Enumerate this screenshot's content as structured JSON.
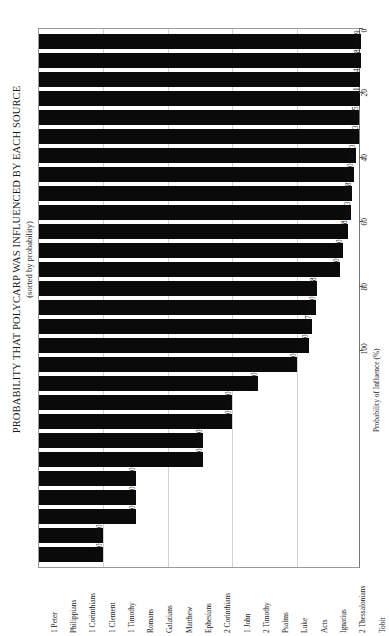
{
  "chart_data": {
    "type": "bar",
    "orientation": "vertical-rotated",
    "title": "PROBABILITY THAT POLYCARP WAS INFLUENCED BY EACH SOURCE",
    "subtitle": "(sorted by probability)",
    "xlabel": "",
    "ylabel": "Probability of Influence (%)",
    "ylim": [
      0,
      100
    ],
    "grid": true,
    "legend": null,
    "tick_labels": [
      "0",
      "20",
      "40",
      "60",
      "80",
      "100"
    ],
    "ticks": [
      0,
      20,
      40,
      60,
      80,
      100
    ],
    "categories": [
      "1 Peter",
      "Philippians",
      "1 Corinthians",
      "1 Clement",
      "1 Timothy",
      "Romans",
      "Galatians",
      "Matthew",
      "Ephesians",
      "2 Corinthians",
      "1 John",
      "2 Timothy",
      "Psalms",
      "Luke",
      "Acts",
      "Ignatius",
      "2 Thessalonians",
      "Tobit",
      "Proverbs",
      "Isaiah",
      "Jeremiah",
      "Hebrews",
      "John",
      "Ezekiel",
      "Mark",
      "1 Thessalonians",
      "Colossians",
      "Sirach"
    ],
    "values": [
      99.99,
      99.88,
      99.74,
      99.61,
      99.45,
      99.23,
      98.43,
      97.8,
      97.18,
      96.93,
      96.08,
      94.4,
      93.6,
      86.28,
      86.0,
      84.87,
      84.0,
      80.0,
      68.0,
      60.0,
      60.0,
      51.0,
      51.0,
      30.0,
      30.0,
      30.0,
      20.0,
      20.0
    ],
    "value_labels": [
      "99.99",
      "99.88",
      "99.74",
      "99.61",
      "99.45",
      "99.23",
      "98.43",
      "97.80",
      "97.18",
      "96.93",
      "96.08",
      "94.40",
      "93.60",
      "86.28",
      "86.00",
      "84.87",
      "84.00",
      "80.00",
      "68.00",
      "60.00",
      "60.00",
      "51.00",
      "51.00",
      "30.00",
      "30.00",
      "30.00",
      "20.00",
      "20.00"
    ],
    "bar_color": "#0a0a0a",
    "grid_color": "#d2d2d2",
    "axis_color": "#9a9a9a"
  }
}
